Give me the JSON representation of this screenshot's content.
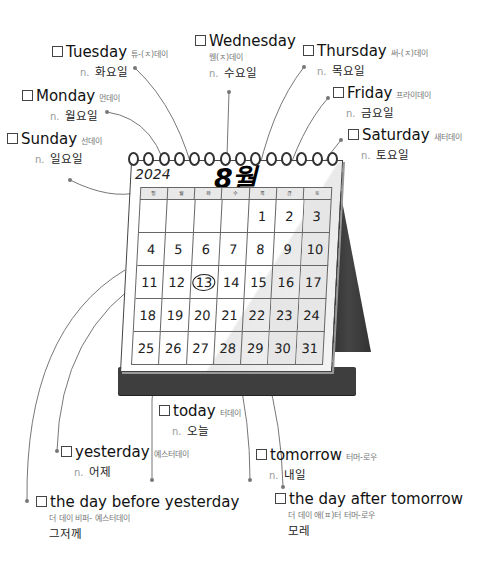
{
  "calendar": {
    "year": "2024",
    "month": "8월",
    "weekday_headers": [
      "일",
      "월",
      "화",
      "수",
      "목",
      "금",
      "토"
    ],
    "weeks": [
      [
        "",
        "",
        "",
        "",
        "1",
        "2",
        "3"
      ],
      [
        "4",
        "5",
        "6",
        "7",
        "8",
        "9",
        "10"
      ],
      [
        "11",
        "12",
        "13",
        "14",
        "15",
        "16",
        "17"
      ],
      [
        "18",
        "19",
        "20",
        "21",
        "22",
        "23",
        "24"
      ],
      [
        "25",
        "26",
        "27",
        "28",
        "29",
        "30",
        "31"
      ]
    ],
    "today": "13"
  },
  "vocab": {
    "sunday": {
      "word": "Sunday",
      "pron": "선데이",
      "pos": "n.",
      "meaning": "일요일"
    },
    "monday": {
      "word": "Monday",
      "pron": "먼데이",
      "pos": "n.",
      "meaning": "월요일"
    },
    "tuesday": {
      "word": "Tuesday",
      "pron": "튜-(ㅈ)데이",
      "pos": "n.",
      "meaning": "화요일"
    },
    "wednesday": {
      "word": "Wednesday",
      "pron": "웬(ㅈ)데이",
      "pos": "n.",
      "meaning": "수요일"
    },
    "thursday": {
      "word": "Thursday",
      "pron": "써-(ㅈ)데이",
      "pos": "n.",
      "meaning": "목요일"
    },
    "friday": {
      "word": "Friday",
      "pron": "프라이데이",
      "pos": "n.",
      "meaning": "금요일"
    },
    "saturday": {
      "word": "Saturday",
      "pron": "새터데이",
      "pos": "n.",
      "meaning": "토요일"
    },
    "today": {
      "word": "today",
      "pron": "터데이",
      "pos": "n.",
      "meaning": "오늘"
    },
    "yesterday": {
      "word": "yesterday",
      "pron": "예스터데이",
      "pos": "n.",
      "meaning": "어제"
    },
    "tomorrow": {
      "word": "tomorrow",
      "pron": "터머-로우",
      "pos": "n.",
      "meaning": "내일"
    },
    "day_before_yesterday": {
      "word": "the day before yesterday",
      "pron": "더 데이 비퍼- 예스터데이",
      "meaning": "그저께"
    },
    "day_after_tomorrow": {
      "word": "the day after tomorrow",
      "pron": "더 데이 애(ㅍ)터 터머-로우",
      "meaning": "모레"
    }
  }
}
